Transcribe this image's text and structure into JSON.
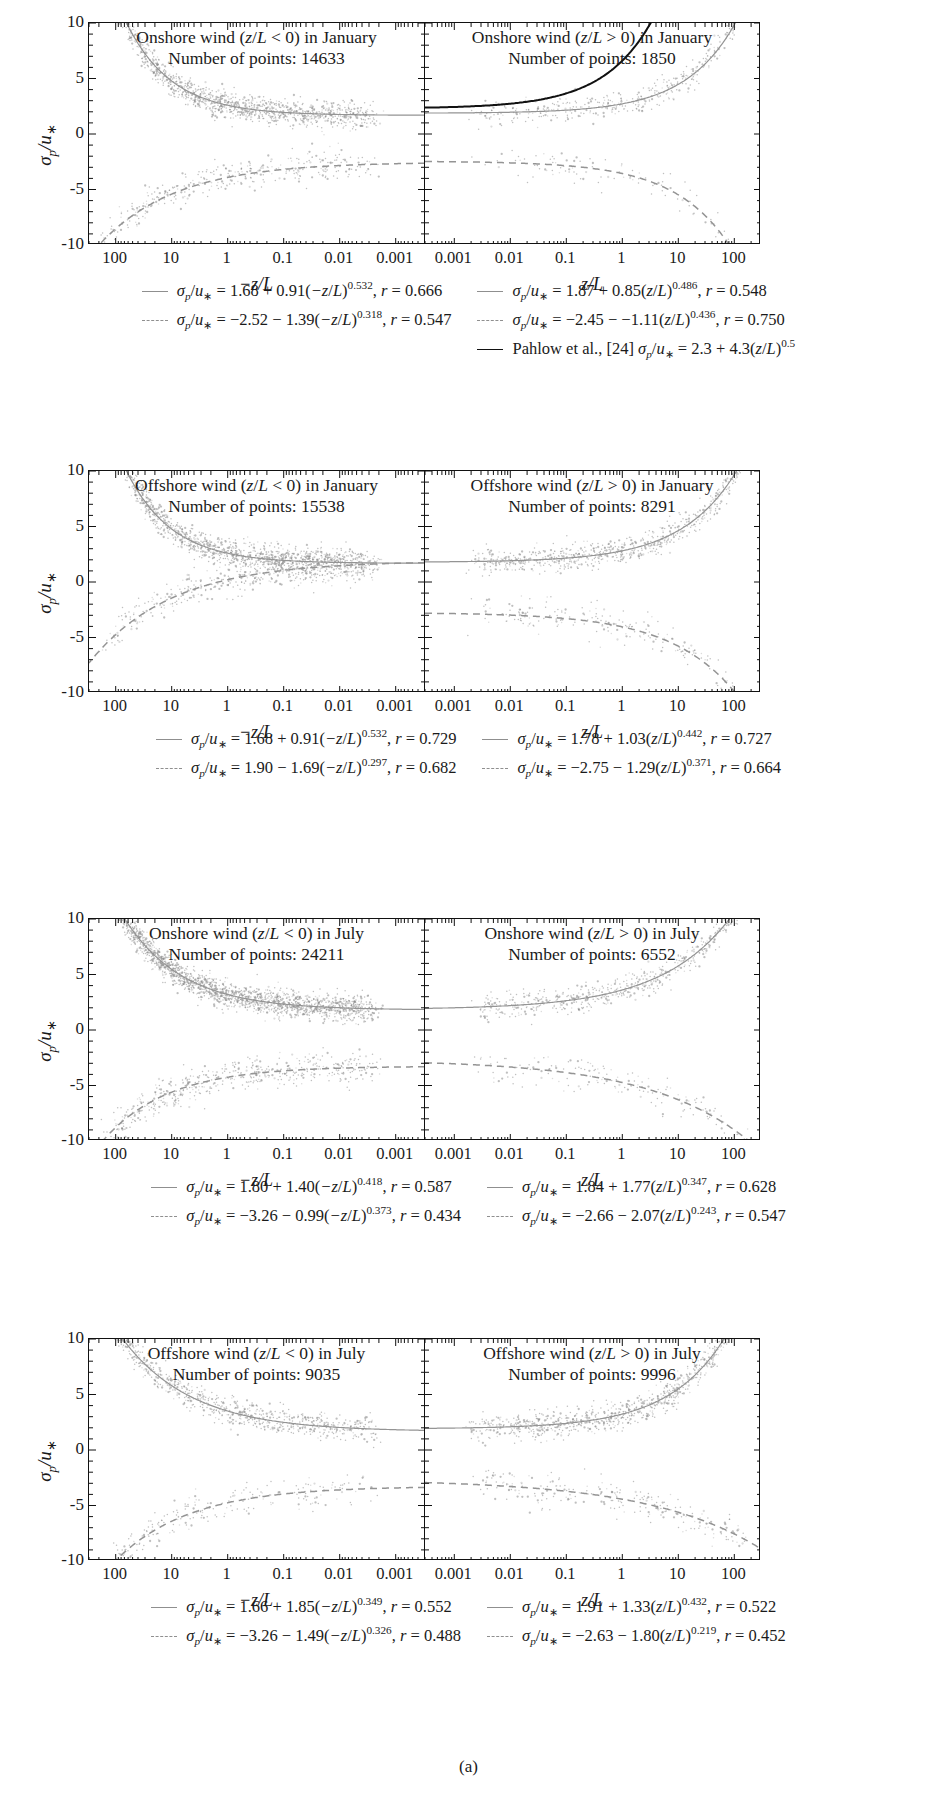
{
  "figure": {
    "caption": "(a)"
  },
  "axis": {
    "ylabel": "σ_p/u_*",
    "yticks": [
      "10",
      "5",
      "0",
      "-5",
      "-10"
    ],
    "ylim": [
      -10,
      10
    ],
    "xticks_neg": [
      "100",
      "10",
      "1",
      "0.1",
      "0.01",
      "0.001"
    ],
    "xticks_pos": [
      "0.001",
      "0.01",
      "0.1",
      "1",
      "10",
      "100"
    ],
    "xlabel_neg": "-z/L",
    "xlabel_pos": "z/L",
    "xlim_neg": [
      300,
      0.0003
    ],
    "xlim_pos": [
      0.0003,
      300
    ]
  },
  "colors": {
    "scatter": "#8a8a8a",
    "fit_line": "#949494",
    "reference_line": "#111111",
    "axis": "#111111"
  },
  "panels": [
    {
      "id": "onshore-january",
      "left": {
        "title_line1": "Onshore wind (z/L < 0) in January",
        "title_line2": "Number of points: 14633",
        "n_points": 14633,
        "fit_upper": {
          "a": 1.68,
          "b": 0.91,
          "p": 0.532,
          "r": 0.666
        },
        "fit_lower": {
          "a": -2.52,
          "b": -1.39,
          "p": 0.318,
          "r": 0.547
        }
      },
      "right": {
        "title_line1": "Onshore wind (z/L > 0) in January",
        "title_line2": "Number of points: 1850",
        "n_points": 1850,
        "fit_upper": {
          "a": 1.87,
          "b": 0.85,
          "p": 0.486,
          "r": 0.548
        },
        "fit_lower": {
          "a": -2.45,
          "b": -1.11,
          "p": 0.436,
          "r": 0.75
        },
        "reference": {
          "label": "Pahlow et al., [24]",
          "a": 2.3,
          "b": 4.3,
          "p": 0.5
        }
      },
      "legend": {
        "left": [
          {
            "marker": "solid",
            "text": "σp/u* = 1.68 + 0.91(-z/L)^0.532, r = 0.666"
          },
          {
            "marker": "dash",
            "text": "σp/u* = -2.52 - 1.39(-z/L)^0.318, r = 0.547"
          }
        ],
        "right": [
          {
            "marker": "solid",
            "text": "σp/u* = 1.87 + 0.85(z/L)^0.486, r = 0.548"
          },
          {
            "marker": "dash",
            "text": "σp/u* = -2.45 - -1.11(z/L)^0.436, r = 0.750"
          },
          {
            "marker": "black",
            "text": "Pahlow et al., [24] σp/u* = 2.3 + 4.3(z/L)^0.5"
          }
        ]
      }
    },
    {
      "id": "offshore-january",
      "left": {
        "title_line1": "Offshore wind (z/L < 0) in January",
        "title_line2": "Number of points: 15538",
        "n_points": 15538,
        "fit_upper": {
          "a": 1.68,
          "b": 0.91,
          "p": 0.532,
          "r": 0.729
        },
        "fit_lower": {
          "a": 1.9,
          "b": -1.69,
          "p": 0.297,
          "r": 0.682
        }
      },
      "right": {
        "title_line1": "Offshore wind (z/L > 0) in January",
        "title_line2": "Number of points: 8291",
        "n_points": 8291,
        "fit_upper": {
          "a": 1.78,
          "b": 1.03,
          "p": 0.442,
          "r": 0.727
        },
        "fit_lower": {
          "a": -2.75,
          "b": -1.29,
          "p": 0.371,
          "r": 0.664
        }
      },
      "legend": {
        "left": [
          {
            "marker": "solid",
            "text": "σp/u* = 1.68 + 0.91(-z/L)^0.532, r = 0.729"
          },
          {
            "marker": "dash",
            "text": "σp/u* = 1.90 - 1.69(-z/L)^0.297, r = 0.682"
          }
        ],
        "right": [
          {
            "marker": "solid",
            "text": "σp/u* = 1.78 + 1.03(z/L)^0.442, r = 0.727"
          },
          {
            "marker": "dash",
            "text": "σp/u* = -2.75 - 1.29(z/L)^0.371, r = 0.664"
          }
        ]
      }
    },
    {
      "id": "onshore-july",
      "left": {
        "title_line1": "Onshore wind (z/L < 0) in July",
        "title_line2": "Number of points: 24211",
        "n_points": 24211,
        "fit_upper": {
          "a": 1.8,
          "b": 1.4,
          "p": 0.418,
          "r": 0.587
        },
        "fit_lower": {
          "a": -3.26,
          "b": -0.99,
          "p": 0.373,
          "r": 0.434
        }
      },
      "right": {
        "title_line1": "Onshore wind (z/L > 0) in July",
        "title_line2": "Number of points: 6552",
        "n_points": 6552,
        "fit_upper": {
          "a": 1.84,
          "b": 1.77,
          "p": 0.347,
          "r": 0.628
        },
        "fit_lower": {
          "a": -2.66,
          "b": -2.07,
          "p": 0.243,
          "r": 0.547
        }
      },
      "legend": {
        "left": [
          {
            "marker": "solid",
            "text": "σp/u* = 1.80 + 1.40(-z/L)^0.418, r = 0.587"
          },
          {
            "marker": "dash",
            "text": "σp/u* = -3.26 - 0.99(-z/L)^0.373, r = 0.434"
          }
        ],
        "right": [
          {
            "marker": "solid",
            "text": "σp/u* = 1.84 + 1.77(z/L)^0.347, r = 0.628"
          },
          {
            "marker": "dash",
            "text": "σp/u* = -2.66 - 2.07(z/L)^0.243, r = 0.547"
          }
        ]
      }
    },
    {
      "id": "offshore-july",
      "left": {
        "title_line1": "Offshore wind (z/L < 0) in July",
        "title_line2": "Number of points: 9035",
        "n_points": 9035,
        "fit_upper": {
          "a": 1.66,
          "b": 1.85,
          "p": 0.349,
          "r": 0.552
        },
        "fit_lower": {
          "a": -3.26,
          "b": -1.49,
          "p": 0.326,
          "r": 0.488
        }
      },
      "right": {
        "title_line1": "Offshore wind (z/L > 0) in July",
        "title_line2": "Number of points: 9996",
        "n_points": 9996,
        "fit_upper": {
          "a": 1.91,
          "b": 1.33,
          "p": 0.432,
          "r": 0.522
        },
        "fit_lower": {
          "a": -2.63,
          "b": -1.8,
          "p": 0.219,
          "r": 0.452
        }
      },
      "legend": {
        "left": [
          {
            "marker": "solid",
            "text": "σp/u* = 1.66 + 1.85(-z/L)^0.349, r = 0.552"
          },
          {
            "marker": "dash",
            "text": "σp/u* = -3.26 - 1.49(-z/L)^0.326, r = 0.488"
          }
        ],
        "right": [
          {
            "marker": "solid",
            "text": "σp/u* = 1.91 + 1.33(z/L)^0.432, r = 0.522"
          },
          {
            "marker": "dash",
            "text": "σp/u* = -2.63 - 1.80(z/L)^0.219, r = 0.452"
          }
        ]
      }
    }
  ],
  "chart_data": {
    "type": "scatter",
    "n_subplots": 8,
    "ylabel": "sigma_p / u_star",
    "ylim": [
      -10,
      10
    ],
    "yticks": [
      -10,
      -5,
      0,
      5,
      10
    ],
    "xscale": "log",
    "grid": false,
    "legend_position": "below each panel row",
    "subplots": [
      {
        "name": "Onshore wind (z/L < 0) in January",
        "xlabel": "-z/L",
        "xlim": [
          300,
          0.0003
        ],
        "xticks": [
          100,
          10,
          1,
          0.1,
          0.01,
          0.001
        ],
        "n_points": 14633,
        "curves": [
          {
            "style": "solid",
            "equation": "sigma_p/u_* = 1.68 + 0.91(-z/L)^0.532",
            "a": 1.68,
            "b": 0.91,
            "p": 0.532,
            "r": 0.666
          },
          {
            "style": "dashed",
            "equation": "sigma_p/u_* = -2.52 - 1.39(-z/L)^0.318",
            "a": -2.52,
            "b": -1.39,
            "p": 0.318,
            "r": 0.547
          }
        ]
      },
      {
        "name": "Onshore wind (z/L > 0) in January",
        "xlabel": "z/L",
        "xlim": [
          0.0003,
          300
        ],
        "xticks": [
          0.001,
          0.01,
          0.1,
          1,
          10,
          100
        ],
        "n_points": 1850,
        "curves": [
          {
            "style": "solid",
            "equation": "sigma_p/u_* = 1.87 + 0.85(z/L)^0.486",
            "a": 1.87,
            "b": 0.85,
            "p": 0.486,
            "r": 0.548
          },
          {
            "style": "dashed",
            "equation": "sigma_p/u_* = -2.45 - -1.11(z/L)^0.436",
            "a": -2.45,
            "b": -1.11,
            "p": 0.436,
            "r": 0.75
          },
          {
            "style": "solid-black",
            "equation": "Pahlow et al., [24] sigma_p/u_* = 2.3 + 4.3(z/L)^0.5",
            "a": 2.3,
            "b": 4.3,
            "p": 0.5
          }
        ]
      },
      {
        "name": "Offshore wind (z/L < 0) in January",
        "xlabel": "-z/L",
        "xlim": [
          300,
          0.0003
        ],
        "xticks": [
          100,
          10,
          1,
          0.1,
          0.01,
          0.001
        ],
        "n_points": 15538,
        "curves": [
          {
            "style": "solid",
            "equation": "sigma_p/u_* = 1.68 + 0.91(-z/L)^0.532",
            "a": 1.68,
            "b": 0.91,
            "p": 0.532,
            "r": 0.729
          },
          {
            "style": "dashed",
            "equation": "sigma_p/u_* = 1.90 - 1.69(-z/L)^0.297",
            "a": 1.9,
            "b": -1.69,
            "p": 0.297,
            "r": 0.682
          }
        ]
      },
      {
        "name": "Offshore wind (z/L > 0) in January",
        "xlabel": "z/L",
        "xlim": [
          0.0003,
          300
        ],
        "xticks": [
          0.001,
          0.01,
          0.1,
          1,
          10,
          100
        ],
        "n_points": 8291,
        "curves": [
          {
            "style": "solid",
            "equation": "sigma_p/u_* = 1.78 + 1.03(z/L)^0.442",
            "a": 1.78,
            "b": 1.03,
            "p": 0.442,
            "r": 0.727
          },
          {
            "style": "dashed",
            "equation": "sigma_p/u_* = -2.75 - 1.29(z/L)^0.371",
            "a": -2.75,
            "b": -1.29,
            "p": 0.371,
            "r": 0.664
          }
        ]
      },
      {
        "name": "Onshore wind (z/L < 0) in July",
        "xlabel": "-z/L",
        "xlim": [
          300,
          0.0003
        ],
        "xticks": [
          100,
          10,
          1,
          0.1,
          0.01,
          0.001
        ],
        "n_points": 24211,
        "curves": [
          {
            "style": "solid",
            "equation": "sigma_p/u_* = 1.80 + 1.40(-z/L)^0.418",
            "a": 1.8,
            "b": 1.4,
            "p": 0.418,
            "r": 0.587
          },
          {
            "style": "dashed",
            "equation": "sigma_p/u_* = -3.26 - 0.99(-z/L)^0.373",
            "a": -3.26,
            "b": -0.99,
            "p": 0.373,
            "r": 0.434
          }
        ]
      },
      {
        "name": "Onshore wind (z/L > 0) in July",
        "xlabel": "z/L",
        "xlim": [
          0.0003,
          300
        ],
        "xticks": [
          0.001,
          0.01,
          0.1,
          1,
          10,
          100
        ],
        "n_points": 6552,
        "curves": [
          {
            "style": "solid",
            "equation": "sigma_p/u_* = 1.84 + 1.77(z/L)^0.347",
            "a": 1.84,
            "b": 1.77,
            "p": 0.347,
            "r": 0.628
          },
          {
            "style": "dashed",
            "equation": "sigma_p/u_* = -2.66 - 2.07(z/L)^0.243",
            "a": -2.66,
            "b": -2.07,
            "p": 0.243,
            "r": 0.547
          }
        ]
      },
      {
        "name": "Offshore wind (z/L < 0) in July",
        "xlabel": "-z/L",
        "xlim": [
          300,
          0.0003
        ],
        "xticks": [
          100,
          10,
          1,
          0.1,
          0.01,
          0.001
        ],
        "n_points": 9035,
        "curves": [
          {
            "style": "solid",
            "equation": "sigma_p/u_* = 1.66 + 1.85(-z/L)^0.349",
            "a": 1.66,
            "b": 1.85,
            "p": 0.349,
            "r": 0.552
          },
          {
            "style": "dashed",
            "equation": "sigma_p/u_* = -3.26 - 1.49(-z/L)^0.326",
            "a": -3.26,
            "b": -1.49,
            "p": 0.326,
            "r": 0.488
          }
        ]
      },
      {
        "name": "Offshore wind (z/L > 0) in July",
        "xlabel": "z/L",
        "xlim": [
          0.0003,
          300
        ],
        "xticks": [
          0.001,
          0.01,
          0.1,
          1,
          10,
          100
        ],
        "n_points": 9996,
        "curves": [
          {
            "style": "solid",
            "equation": "sigma_p/u_* = 1.91 + 1.33(z/L)^0.432",
            "a": 1.91,
            "b": 1.33,
            "p": 0.432,
            "r": 0.522
          },
          {
            "style": "dashed",
            "equation": "sigma_p/u_* = -2.63 - 1.80(z/L)^0.219",
            "a": -2.63,
            "b": -1.8,
            "p": 0.219,
            "r": 0.452
          }
        ]
      }
    ]
  }
}
